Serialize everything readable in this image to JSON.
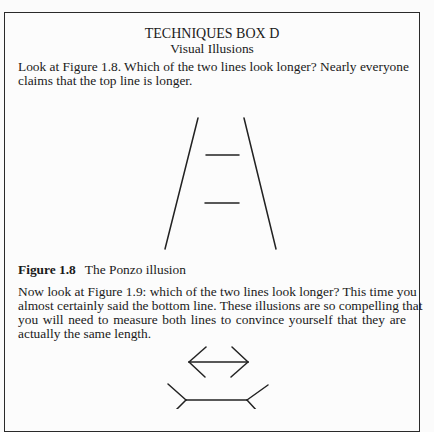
{
  "box": {
    "title": "TECHNIQUES BOX D",
    "subtitle": "Visual Illusions"
  },
  "paragraph1": {
    "lines": [
      "Look at Figure 1.8. Which of the two lines look longer? Nearly everyone",
      "claims that the top line is longer."
    ]
  },
  "figure_1_8": {
    "label": "Figure 1.8",
    "caption": "The Ponzo illusion",
    "illustration": "ponzo-illusion"
  },
  "paragraph2": {
    "lines": [
      "Now look at Figure 1.9: which of the two lines look longer? This time you",
      "almost certainly said the bottom line. These illusions are so compelling that",
      "you will need to measure both lines to convince yourself that they are",
      "actually the same length."
    ]
  },
  "figure_1_9": {
    "illustration": "muller-lyer-illusion"
  }
}
